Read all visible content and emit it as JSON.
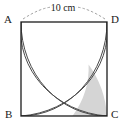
{
  "figure": {
    "shape": "square",
    "dimension_label": "10 cm",
    "side_length": 10,
    "units": "cm",
    "vertices": [
      {
        "name": "A",
        "label": "A",
        "position": "top-left"
      },
      {
        "name": "D",
        "label": "D",
        "position": "top-right"
      },
      {
        "name": "B",
        "label": "B",
        "position": "bottom-left"
      },
      {
        "name": "C",
        "label": "C",
        "position": "bottom-right"
      }
    ],
    "arcs": [
      {
        "name": "arc-from-A",
        "center": "A",
        "radius": 10,
        "from": "B",
        "to": "D"
      },
      {
        "name": "arc-from-D",
        "center": "D",
        "radius": 10,
        "from": "A",
        "to": "C"
      },
      {
        "name": "arc-from-B",
        "center": "B",
        "radius": 10,
        "from": "A",
        "to": "C"
      },
      {
        "name": "arc-from-C",
        "center": "C",
        "radius": 10,
        "from": "B",
        "to": "D"
      }
    ],
    "shaded_region": {
      "name": "shaded-region",
      "description": "lens shaped region near corner C",
      "fill": "#d5d5d5"
    },
    "colors": {
      "outline": "#1c1c1c",
      "arc": "#4a4a4a",
      "shade": "#d5d5d5",
      "leader": "#9a9a9a",
      "background": "#ffffff",
      "text": "#1a1a1a"
    }
  }
}
